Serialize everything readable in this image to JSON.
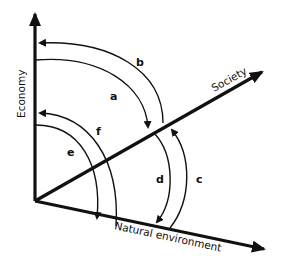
{
  "diagram": {
    "axes": {
      "economy": {
        "label": "Economy"
      },
      "society": {
        "label": "Society"
      },
      "natural_environment": {
        "label": "Natural environment"
      }
    },
    "arcs": [
      {
        "id": "a",
        "label": "a",
        "from": "Economy",
        "to": "Society"
      },
      {
        "id": "b",
        "label": "b",
        "from": "Society",
        "to": "Economy"
      },
      {
        "id": "c",
        "label": "c",
        "from": "Natural environment",
        "to": "Society"
      },
      {
        "id": "d",
        "label": "d",
        "from": "Society",
        "to": "Natural environment"
      },
      {
        "id": "e",
        "label": "e",
        "from": "Economy",
        "to": "Natural environment"
      },
      {
        "id": "f",
        "label": "f",
        "from": "Natural environment",
        "to": "Economy"
      }
    ],
    "colors": {
      "ink": "#111111",
      "background": "#ffffff"
    }
  }
}
